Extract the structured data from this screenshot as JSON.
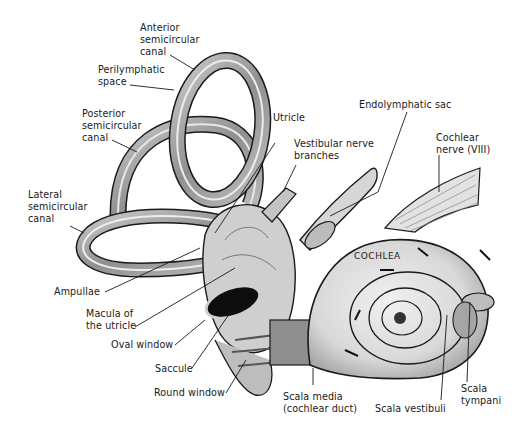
{
  "diagram": {
    "style": "grayscale illustration",
    "colors": {
      "background": "#ffffff",
      "ink": "#1a1a1a",
      "shade": "#9a9a9a",
      "light": "#e6e6e6",
      "dark_window": "#0d0d0d"
    },
    "labels": {
      "anterior_canal": "Anterior\nsemicircular\ncanal",
      "perilymphatic_space": "Perilymphatic\nspace",
      "posterior_canal": "Posterior\nsemicircular\ncanal",
      "lateral_canal": "Lateral\nsemicircular\ncanal",
      "utricle": "Utricle",
      "vestibular_nerve": "Vestibular nerve\nbranches",
      "endolymphatic_sac": "Endolymphatic sac",
      "cochlear_nerve": "Cochlear\nnerve (VIII)",
      "cochlea": "COCHLEA",
      "ampullae": "Ampullae",
      "macula": "Macula of\nthe utricle",
      "oval_window": "Oval window",
      "saccule": "Saccule",
      "round_window": "Round window",
      "scala_media": "Scala media\n(cochlear duct)",
      "scala_vestibuli": "Scala vestibuli",
      "scala_tympani": "Scala\ntympani"
    }
  }
}
